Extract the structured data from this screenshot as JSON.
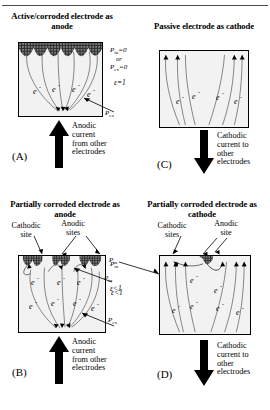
{
  "figure": {
    "panels": [
      {
        "id": "A",
        "marker": "(A)",
        "title": "Active/corroded\nelectrode as anode",
        "current_label": "Anodic\ncurrent\nfrom other\nelectrodes",
        "current_direction": "up",
        "electron_symbol": "e",
        "superscript": "-",
        "p_in_label": "P",
        "p_in_sub": "in",
        "p_in_value": "=0",
        "or_label": "or",
        "p_ex_label": "P",
        "p_ex_sub": "ex",
        "p_ex_value": "=0",
        "epsilon": "ε=1",
        "p_ex_pointer": "P",
        "p_ex_pointer_sub": "ex",
        "site_labels": []
      },
      {
        "id": "C",
        "marker": "(C)",
        "title": "Passive electrode\nas cathode",
        "current_label": "Cathodic\ncurrent to\nother\nelectrodes",
        "current_direction": "down",
        "electron_symbol": "e",
        "superscript": "-",
        "site_labels": []
      },
      {
        "id": "B",
        "marker": "(B)",
        "title": "Partially corroded\nelectrode as anode",
        "current_label": "Anodic\ncurrent\nfrom other\nelectrodes",
        "current_direction": "up",
        "electron_symbol": "e",
        "superscript": "-",
        "cathodic_label": "Cathodic\nsite",
        "anodic_label": "Anodic\nsites",
        "p_in_label": "P",
        "p_in_sub": "in",
        "p_ex_label": "P",
        "p_ex_sub": "ex",
        "p_in_pointer": "P",
        "p_in_pointer_sub": "in",
        "epsilon": "ε<1"
      },
      {
        "id": "D",
        "marker": "(D)",
        "title": "Partially corroded\nelectrode as cathode",
        "current_label": "Cathodic\ncurrent to\nother\nelectrodes",
        "current_direction": "down",
        "electron_symbol": "e",
        "superscript": "-",
        "cathodic_label": "Cathodic\nsites",
        "anodic_label": "Anodic\nsite",
        "p_in_label": "P",
        "p_in_sub": "in",
        "epsilon": "ε<1"
      }
    ],
    "colors": {
      "electrode_fill": "#f2f2f2",
      "border": "#000000",
      "corrosion_patch": "#2b2b2b",
      "flow_line": "#555555"
    }
  }
}
